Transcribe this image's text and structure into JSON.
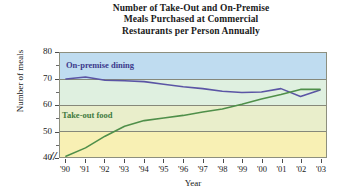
{
  "chart_data": {
    "type": "line",
    "title": "Number of Take-Out and On-Premise Meals Purchased at Commercial Restaurants per Person Annually",
    "title_lines": [
      "Number of Take-Out and On-Premise",
      "Meals Purchased at Commercial",
      "Restaurants per Person Annually"
    ],
    "xlabel": "Year",
    "ylabel": "Number of meals",
    "categories": [
      "'90",
      "'91",
      "'92",
      "'93",
      "'94",
      "'95",
      "'96",
      "'97",
      "'98",
      "'99",
      "'00",
      "'01",
      "'02",
      "'03"
    ],
    "x_tick_labels": [
      "'90",
      "'91",
      "'92",
      "'93",
      "'94",
      "'95",
      "'96",
      "'97",
      "'98",
      "'99",
      "'00",
      "'01",
      "'02",
      "'03"
    ],
    "y_tick_labels": [
      "80",
      "70",
      "60",
      "50",
      "40"
    ],
    "y_ticks": [
      80,
      70,
      60,
      50,
      40
    ],
    "ylim": [
      40,
      80
    ],
    "xlim_labels": [
      "'90",
      "'03"
    ],
    "grid": true,
    "axis_break": "//",
    "legend_position": "inside-plot",
    "series": [
      {
        "name": "On-premise dining",
        "color": "#5b55a5",
        "label_color": "#3c3a8c",
        "values": [
          70.0,
          70.8,
          69.5,
          69.3,
          69.0,
          68.0,
          67.0,
          66.3,
          65.3,
          64.8,
          65.0,
          66.3,
          63.3,
          65.8
        ]
      },
      {
        "name": "Take-out food",
        "color": "#4f8f4a",
        "label_color": "#3f7a3f",
        "values": [
          40.3,
          43.5,
          48.0,
          51.8,
          54.0,
          55.0,
          56.0,
          57.3,
          58.5,
          60.3,
          62.3,
          64.0,
          66.0,
          66.0
        ]
      }
    ],
    "bands": [
      {
        "from": 80,
        "to": 70,
        "color": "#bfdcf0"
      },
      {
        "from": 70,
        "to": 60,
        "color": "#dff0e0"
      },
      {
        "from": 60,
        "to": 50,
        "color": "#e9eecb"
      },
      {
        "from": 50,
        "to": 40,
        "color": "#f8f0b4"
      }
    ]
  }
}
